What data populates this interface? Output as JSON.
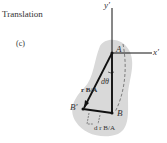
{
  "title": "Translation",
  "part": "(c)",
  "labels": {
    "y_axis": "y′",
    "x_axis": "x′",
    "A": "A",
    "B": "B",
    "B_prime": "B′",
    "angle": "dθ",
    "r_BA": "r B/A",
    "dr_BA": "d r B/A"
  },
  "colors": {
    "body_fill": "#d9d9d9",
    "line": "#111111"
  }
}
